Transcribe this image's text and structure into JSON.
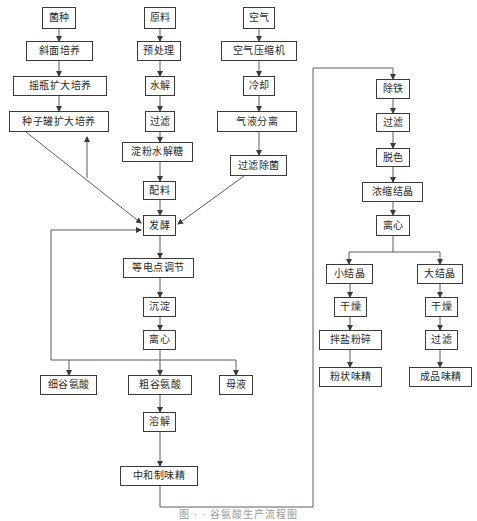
{
  "diagram": {
    "type": "flowchart",
    "caption": "图 · · 谷氨酸生产流程图",
    "line_color": "#4a4a4a",
    "nodes": {
      "n1": "菌种",
      "n2": "斜面培养",
      "n3": "摇瓶扩大培养",
      "n4": "种子罐扩大培养",
      "n5": "原料",
      "n6": "预处理",
      "n7": "水解",
      "n8": "过滤",
      "n9": "淀粉水解糖",
      "n10": "配料",
      "n11": "空气",
      "n12": "空气压缩机",
      "n13": "冷却",
      "n14": "气液分离",
      "n15": "过滤除菌",
      "n16": "发酵",
      "n17": "等电点调节",
      "n18": "沉淀",
      "n19": "离心",
      "n20": "细谷氨酸",
      "n21": "粗谷氨酸",
      "n22": "母液",
      "n23": "溶解",
      "n24": "中和制味精",
      "n25": "除铁",
      "n26": "过滤",
      "n27": "脱色",
      "n28": "浓缩结晶",
      "n29": "离心",
      "n30": "小结晶",
      "n31": "大结晶",
      "n32": "干燥",
      "n33": "干燥",
      "n34": "拌盐粉碎",
      "n35": "过滤",
      "n36": "粉状味精",
      "n37": "成品味精"
    },
    "edges": [
      [
        "菌种",
        "斜面培养"
      ],
      [
        "斜面培养",
        "摇瓶扩大培养"
      ],
      [
        "摇瓶扩大培养",
        "种子罐扩大培养"
      ],
      [
        "种子罐扩大培养",
        "发酵"
      ],
      [
        "原料",
        "预处理"
      ],
      [
        "预处理",
        "水解"
      ],
      [
        "水解",
        "过滤"
      ],
      [
        "过滤",
        "淀粉水解糖"
      ],
      [
        "淀粉水解糖",
        "配料"
      ],
      [
        "配料",
        "发酵"
      ],
      [
        "空气",
        "空气压缩机"
      ],
      [
        "空气压缩机",
        "冷却"
      ],
      [
        "冷却",
        "气液分离"
      ],
      [
        "气液分离",
        "过滤除菌"
      ],
      [
        "过滤除菌",
        "发酵"
      ],
      [
        "发酵",
        "等电点调节"
      ],
      [
        "等电点调节",
        "沉淀"
      ],
      [
        "沉淀",
        "离心"
      ],
      [
        "离心",
        "细谷氨酸"
      ],
      [
        "离心",
        "粗谷氨酸"
      ],
      [
        "离心",
        "母液"
      ],
      [
        "细谷氨酸 (loop)",
        "发酵"
      ],
      [
        "粗谷氨酸",
        "溶解"
      ],
      [
        "溶解",
        "中和制味精"
      ],
      [
        "中和制味精",
        "除铁"
      ],
      [
        "除铁",
        "过滤"
      ],
      [
        "过滤",
        "脱色"
      ],
      [
        "脱色",
        "浓缩结晶"
      ],
      [
        "浓缩结晶",
        "离心"
      ],
      [
        "离心",
        "小结晶"
      ],
      [
        "离心",
        "大结晶"
      ],
      [
        "小结晶",
        "干燥"
      ],
      [
        "干燥",
        "拌盐粉碎"
      ],
      [
        "拌盐粉碎",
        "粉状味精"
      ],
      [
        "大结晶",
        "干燥"
      ],
      [
        "干燥",
        "过滤"
      ],
      [
        "过滤",
        "成品味精"
      ]
    ]
  }
}
